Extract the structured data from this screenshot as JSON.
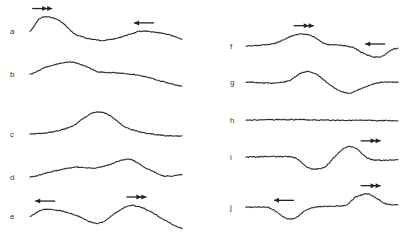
{
  "figure": {
    "caption": "",
    "panels": [
      {
        "id": "a",
        "label": "a",
        "column": "left",
        "points": [
          [
            0,
            0.35
          ],
          [
            0.06,
            0.9
          ],
          [
            0.12,
            1.0
          ],
          [
            0.2,
            0.8
          ],
          [
            0.3,
            0.2
          ],
          [
            0.45,
            -0.05
          ],
          [
            0.55,
            0.0
          ],
          [
            0.65,
            0.2
          ],
          [
            0.73,
            0.35
          ],
          [
            0.82,
            0.3
          ],
          [
            0.9,
            0.22
          ],
          [
            1.0,
            0.0
          ]
        ],
        "arrows": [
          {
            "direction": "right",
            "type": "double",
            "at": 0.08
          },
          {
            "direction": "left",
            "type": "single",
            "at": 0.75
          }
        ]
      },
      {
        "id": "b",
        "label": "b",
        "column": "left",
        "points": [
          [
            0,
            0.45
          ],
          [
            0.1,
            0.75
          ],
          [
            0.25,
            1.0
          ],
          [
            0.35,
            0.85
          ],
          [
            0.45,
            0.55
          ],
          [
            0.6,
            0.5
          ],
          [
            0.75,
            0.35
          ],
          [
            0.88,
            0.1
          ],
          [
            1.0,
            -0.1
          ]
        ],
        "arrows": []
      },
      {
        "id": "c",
        "label": "c",
        "column": "left",
        "points": [
          [
            0,
            0.0
          ],
          [
            0.15,
            0.1
          ],
          [
            0.28,
            0.35
          ],
          [
            0.36,
            0.75
          ],
          [
            0.44,
            1.0
          ],
          [
            0.52,
            0.85
          ],
          [
            0.62,
            0.35
          ],
          [
            0.72,
            0.1
          ],
          [
            0.85,
            -0.05
          ],
          [
            1.0,
            -0.1
          ]
        ],
        "arrows": []
      },
      {
        "id": "d",
        "label": "d",
        "column": "left",
        "points": [
          [
            0,
            0.0
          ],
          [
            0.15,
            0.25
          ],
          [
            0.3,
            0.45
          ],
          [
            0.42,
            0.4
          ],
          [
            0.52,
            0.55
          ],
          [
            0.6,
            0.75
          ],
          [
            0.66,
            0.8
          ],
          [
            0.75,
            0.45
          ],
          [
            0.88,
            0.05
          ],
          [
            1.0,
            0.1
          ]
        ],
        "arrows": []
      },
      {
        "id": "e",
        "label": "e",
        "column": "left",
        "points": [
          [
            0,
            0.35
          ],
          [
            0.08,
            0.65
          ],
          [
            0.2,
            0.6
          ],
          [
            0.3,
            0.4
          ],
          [
            0.42,
            0.05
          ],
          [
            0.48,
            0.1
          ],
          [
            0.55,
            0.45
          ],
          [
            0.64,
            0.8
          ],
          [
            0.7,
            0.82
          ],
          [
            0.78,
            0.6
          ],
          [
            0.88,
            0.2
          ],
          [
            1.0,
            -0.2
          ]
        ],
        "arrows": [
          {
            "direction": "left",
            "type": "single",
            "at": 0.1
          },
          {
            "direction": "right",
            "type": "double",
            "at": 0.7
          }
        ]
      },
      {
        "id": "f",
        "label": "f",
        "column": "right",
        "points": [
          [
            0,
            0.45
          ],
          [
            0.1,
            0.5
          ],
          [
            0.2,
            0.6
          ],
          [
            0.3,
            0.9
          ],
          [
            0.38,
            1.0
          ],
          [
            0.45,
            0.85
          ],
          [
            0.52,
            0.55
          ],
          [
            0.6,
            0.5
          ],
          [
            0.7,
            0.4
          ],
          [
            0.78,
            0.1
          ],
          [
            0.85,
            -0.05
          ],
          [
            0.9,
            0.0
          ],
          [
            0.95,
            0.25
          ],
          [
            1.0,
            0.35
          ]
        ],
        "arrows": [
          {
            "direction": "right",
            "type": "double",
            "at": 0.38
          },
          {
            "direction": "left",
            "type": "single",
            "at": 0.85
          }
        ]
      },
      {
        "id": "g",
        "label": "g",
        "column": "right",
        "points": [
          [
            0,
            0.5
          ],
          [
            0.15,
            0.45
          ],
          [
            0.28,
            0.55
          ],
          [
            0.38,
            0.95
          ],
          [
            0.45,
            0.9
          ],
          [
            0.52,
            0.55
          ],
          [
            0.6,
            0.15
          ],
          [
            0.68,
            0.0
          ],
          [
            0.76,
            0.2
          ],
          [
            0.86,
            0.45
          ],
          [
            1.0,
            0.5
          ]
        ],
        "arrows": []
      },
      {
        "id": "h",
        "label": "h",
        "column": "right",
        "points": [
          [
            0,
            0.5
          ],
          [
            0.25,
            0.52
          ],
          [
            0.5,
            0.5
          ],
          [
            0.75,
            0.48
          ],
          [
            1.0,
            0.47
          ]
        ],
        "arrows": []
      },
      {
        "id": "i",
        "label": "i",
        "column": "right",
        "points": [
          [
            0,
            0.5
          ],
          [
            0.25,
            0.52
          ],
          [
            0.33,
            0.45
          ],
          [
            0.4,
            0.05
          ],
          [
            0.45,
            -0.05
          ],
          [
            0.52,
            0.05
          ],
          [
            0.58,
            0.5
          ],
          [
            0.66,
            0.95
          ],
          [
            0.72,
            0.9
          ],
          [
            0.8,
            0.45
          ],
          [
            0.88,
            0.35
          ],
          [
            1.0,
            0.38
          ]
        ],
        "arrows": [
          {
            "direction": "right",
            "type": "double",
            "at": 0.82
          }
        ]
      },
      {
        "id": "j",
        "label": "j",
        "column": "right",
        "points": [
          [
            0,
            0.4
          ],
          [
            0.14,
            0.4
          ],
          [
            0.2,
            0.2
          ],
          [
            0.26,
            -0.1
          ],
          [
            0.32,
            -0.1
          ],
          [
            0.38,
            0.2
          ],
          [
            0.45,
            0.4
          ],
          [
            0.6,
            0.45
          ],
          [
            0.66,
            0.5
          ],
          [
            0.72,
            0.85
          ],
          [
            0.8,
            1.0
          ],
          [
            0.86,
            0.8
          ],
          [
            0.92,
            0.55
          ],
          [
            1.0,
            0.5
          ]
        ],
        "arrows": [
          {
            "direction": "left",
            "type": "single",
            "at": 0.25
          },
          {
            "direction": "right",
            "type": "double",
            "at": 0.82
          }
        ]
      }
    ]
  }
}
